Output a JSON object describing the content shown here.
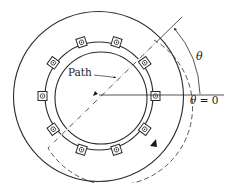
{
  "figure": {
    "type": "electric machine cross-section",
    "labels": {
      "path": "Path",
      "theta": "θ",
      "theta_zero_symbol": "θ",
      "theta_zero_rest": " = 0"
    },
    "components": [
      {
        "name": "stator-outer-circle"
      },
      {
        "name": "stator-inner-ring-with-slots",
        "slot_count": 10
      },
      {
        "name": "rotor-circle"
      },
      {
        "name": "integration-path-dashed"
      },
      {
        "name": "angle-reference-line",
        "label": "θ = 0"
      },
      {
        "name": "angle-arc",
        "label": "θ"
      }
    ],
    "colors": {
      "line": "#2a2a2a",
      "background": "#ffffff"
    }
  }
}
